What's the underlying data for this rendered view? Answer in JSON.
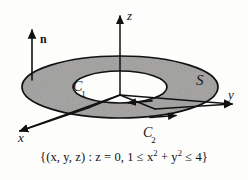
{
  "figure": {
    "caption": "{(x, y, z) : z = 0, 1 ≤ x² + y² ≤ 4}",
    "caption_parts": {
      "lead": "{(x, y, z) : z = 0, 1 ≤ x",
      "sup1": "2",
      "mid": " + y",
      "sup2": "2",
      "tail": " ≤ 4}"
    },
    "colors": {
      "background": "#fdfdfc",
      "surface_fill": "#aaa9a8",
      "stroke": "#111111",
      "text": "#141414"
    },
    "axes": [
      {
        "name": "x-axis",
        "label": "x",
        "direction": "down-left"
      },
      {
        "name": "y-axis",
        "label": "y",
        "direction": "right"
      },
      {
        "name": "z-axis",
        "label": "z",
        "direction": "up"
      }
    ],
    "normal_vector": {
      "label": "n",
      "description": "upward unit normal vector"
    },
    "curves": [
      {
        "name": "inner-boundary",
        "label": "C",
        "subscript": "1",
        "orientation": "clockwise-from-above",
        "radius": 1
      },
      {
        "name": "outer-boundary",
        "label": "C",
        "subscript": "2",
        "orientation": "counterclockwise-from-above",
        "radius": 2
      }
    ],
    "surface": {
      "label": "S",
      "inner_radius": 1,
      "outer_radius": 2,
      "plane": "z = 0"
    }
  }
}
